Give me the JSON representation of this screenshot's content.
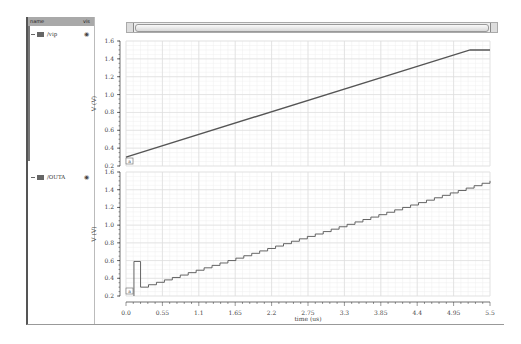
{
  "signal_panel": {
    "header_name": "name",
    "header_vis": "vis",
    "signals": [
      {
        "name": "/vip",
        "color": "#666666",
        "visible_icon": "eye-icon"
      },
      {
        "name": "/OUTA",
        "color": "#666666",
        "visible_icon": "eye-icon"
      }
    ]
  },
  "x_axis": {
    "label": "time (us)",
    "ticks": [
      "0.0",
      "0.55",
      "1.1",
      "1.65",
      "2.2",
      "2.75",
      "3.3",
      "3.85",
      "4.4",
      "4.95",
      "5.5"
    ]
  },
  "panels": [
    {
      "ylabel": "V (V)",
      "yticks": [
        "1.6",
        "1.4",
        "1.2",
        "1.0",
        "0.8",
        "0.6",
        "0.4",
        "0.2"
      ],
      "marker": "a"
    },
    {
      "ylabel": "V (V)",
      "yticks": [
        "1.6",
        "1.4",
        "1.2",
        "1.0",
        "0.8",
        "0.6",
        "0.4",
        "0.2"
      ],
      "marker": "a"
    }
  ],
  "chart_data": [
    {
      "type": "line",
      "title": "/vip",
      "xlabel": "time (us)",
      "ylabel": "V (V)",
      "xlim": [
        0,
        5.5
      ],
      "ylim": [
        0.2,
        1.6
      ],
      "grid": true,
      "series": [
        {
          "name": "/vip",
          "x": [
            0.0,
            5.2,
            5.5
          ],
          "y": [
            0.3,
            1.5,
            1.5
          ]
        }
      ]
    },
    {
      "type": "line",
      "title": "/OUTA",
      "xlabel": "time (us)",
      "ylabel": "V (V)",
      "xlim": [
        0,
        5.5
      ],
      "ylim": [
        0.2,
        1.6
      ],
      "grid": true,
      "series": [
        {
          "name": "/OUTA",
          "step": true,
          "x": [
            0.0,
            0.1,
            0.1,
            0.22,
            0.22,
            5.5
          ],
          "y": [
            0.2,
            0.2,
            0.59,
            0.59,
            0.3,
            1.5
          ],
          "note": "staircase ramp from ~0.3V at 0.22us to ~1.5V at 5.5us with small steps"
        }
      ]
    }
  ]
}
